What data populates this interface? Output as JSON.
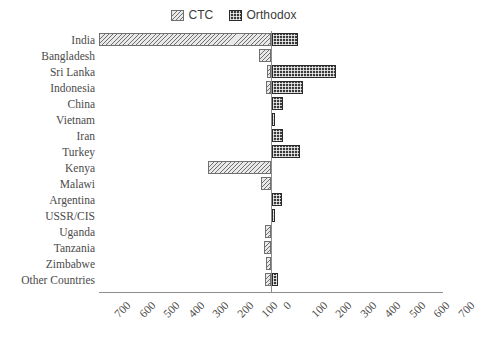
{
  "chart_data": {
    "type": "bar",
    "orientation": "horizontal",
    "subtype": "diverging-butterfly",
    "title": "",
    "xlabel": "",
    "ylabel": "",
    "xlim": [
      -700,
      700
    ],
    "xticks": [
      700,
      600,
      500,
      400,
      300,
      200,
      100,
      0,
      100,
      200,
      300,
      400,
      500,
      600,
      700
    ],
    "xtick_labels": [
      "700",
      "600",
      "500",
      "400",
      "300",
      "200",
      "100",
      "0",
      "100",
      "200",
      "300",
      "400",
      "500",
      "600",
      "700"
    ],
    "grid": false,
    "legend_position": "top-center",
    "categories": [
      "India",
      "Bangladesh",
      "Sri Lanka",
      "Indonesia",
      "China",
      "Vietnam",
      "Iran",
      "Turkey",
      "Kenya",
      "Malawi",
      "Argentina",
      "USSR/CIS",
      "Uganda",
      "Tanzania",
      "Zimbabwe",
      "Other Countries"
    ],
    "series": [
      {
        "name": "CTC",
        "direction": "left",
        "color": "#e9e9e9",
        "pattern": "diagonal-hatch",
        "values": [
          700,
          50,
          15,
          20,
          0,
          0,
          0,
          0,
          255,
          40,
          0,
          0,
          25,
          30,
          20,
          25
        ]
      },
      {
        "name": "Orthodox",
        "direction": "right",
        "color": "#3a3a3a",
        "pattern": "checker-dot",
        "values": [
          105,
          0,
          260,
          125,
          45,
          5,
          45,
          115,
          0,
          0,
          40,
          5,
          0,
          0,
          0,
          25
        ]
      }
    ],
    "legend": [
      {
        "label": "CTC",
        "swatch": "ctc-swatch"
      },
      {
        "label": "Orthodox",
        "swatch": "orthodox-swatch"
      }
    ]
  }
}
